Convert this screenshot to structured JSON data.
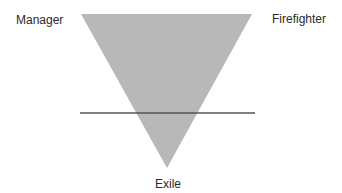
{
  "diagram": {
    "labels": {
      "top_left": "Manager",
      "top_right": "Firefighter",
      "bottom": "Exile"
    },
    "shapes": {
      "triangle": {
        "orientation": "inverted",
        "fill": "#b8b8b8",
        "points": [
          [
            81,
            14
          ],
          [
            252,
            14
          ],
          [
            167,
            168
          ]
        ]
      },
      "horizontal_line": {
        "stroke": "#555555",
        "x1": 80,
        "y1": 113,
        "x2": 255,
        "y2": 113
      }
    }
  }
}
